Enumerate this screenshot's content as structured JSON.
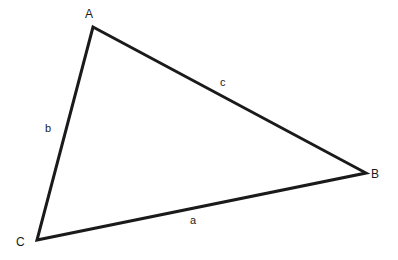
{
  "figure": {
    "type": "geometry-diagram",
    "shape": "triangle",
    "background_color": "#ffffff",
    "stroke_color": "#1a1a1a",
    "stroke_width": 3,
    "width": 398,
    "height": 260
  },
  "vertices": [
    {
      "id": "A",
      "label": "A",
      "x": 93,
      "y": 27
    },
    {
      "id": "B",
      "label": "B",
      "x": 366,
      "y": 173
    },
    {
      "id": "C",
      "label": "C",
      "x": 37,
      "y": 240
    }
  ],
  "sides": [
    {
      "id": "a",
      "label": "a",
      "from": "C",
      "to": "B",
      "label_x": 194,
      "label_y": 222
    },
    {
      "id": "b",
      "label": "b",
      "from": "A",
      "to": "C",
      "label_x": 49,
      "label_y": 130
    },
    {
      "id": "c",
      "label": "c",
      "from": "A",
      "to": "B",
      "label_x": 224,
      "label_y": 84
    }
  ],
  "geometry": {
    "path": "M 93 27 L 366 173 L 37 240 Z",
    "fill": "none"
  }
}
